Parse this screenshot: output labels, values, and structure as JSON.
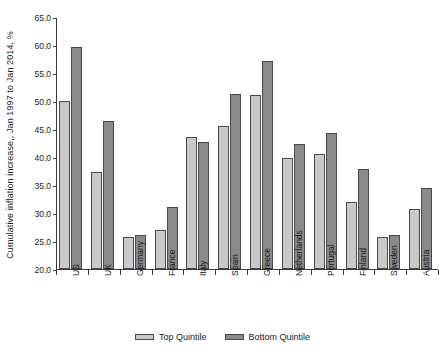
{
  "chart_data": {
    "type": "bar",
    "title": "",
    "xlabel": "",
    "ylabel": "Cumulative inflation increase,, Jan 1997 to Jan 2014, %",
    "ylim": [
      20.0,
      65.0
    ],
    "ytick_step": 5.0,
    "grid": false,
    "legend_position": "bottom-center",
    "ytick_labels": [
      "65.0",
      "60.0",
      "55.0",
      "50.0",
      "45.0",
      "40.0",
      "35.0",
      "30.0",
      "25.0",
      "20.0"
    ],
    "ytick_values": [
      65.0,
      60.0,
      55.0,
      50.0,
      45.0,
      40.0,
      35.0,
      30.0,
      25.0,
      20.0
    ],
    "categories": [
      "US",
      "UK",
      "Germany",
      "France",
      "Italy",
      "Spain",
      "Greece",
      "Netherlands",
      "Portugal",
      "Finland",
      "Sweden",
      "Austria"
    ],
    "series": [
      {
        "name": "Top Quintile",
        "color": "#c9c9c9",
        "values": [
          50.0,
          37.4,
          25.8,
          26.9,
          43.5,
          45.6,
          51.0,
          39.9,
          40.6,
          32.0,
          25.8,
          30.8
        ]
      },
      {
        "name": "Bottom Quintile",
        "color": "#8a8a8a",
        "values": [
          59.6,
          46.4,
          26.0,
          31.1,
          42.7,
          51.2,
          57.2,
          42.3,
          44.2,
          37.8,
          26.0,
          34.4
        ]
      }
    ]
  },
  "legend": {
    "entries": [
      {
        "label": "Top Quintile",
        "swatch": "top-q"
      },
      {
        "label": "Bottom Quintile",
        "swatch": "bottom-q"
      }
    ]
  }
}
